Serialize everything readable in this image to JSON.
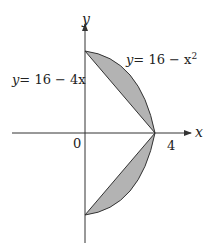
{
  "diagram": {
    "axes": {
      "x_label": "x",
      "y_label": "y",
      "origin_label": "0",
      "x_tick_label": "4"
    },
    "curves": [
      {
        "name": "parabola",
        "label_lhs": "y",
        "label_rhs": "= 16 − x",
        "label_exp": "2"
      },
      {
        "name": "line",
        "label_lhs": "y",
        "label_rhs": "= 16 − 4x"
      }
    ],
    "colors": {
      "region_fill": "#b3b3b3",
      "stroke": "#333333",
      "background": "#ffffff"
    }
  }
}
